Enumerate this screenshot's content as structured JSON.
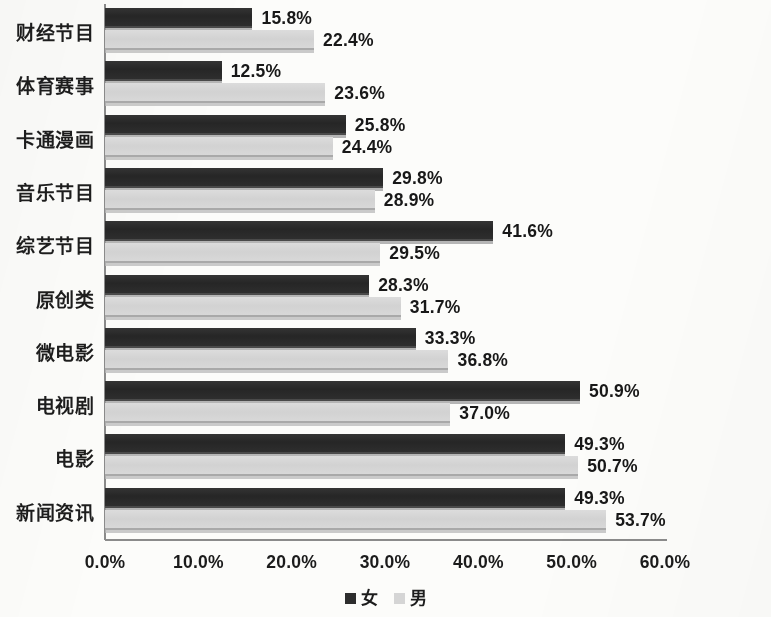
{
  "chart_data": {
    "type": "bar",
    "orientation": "horizontal",
    "title": "",
    "subtitle": "",
    "xlabel": "",
    "ylabel": "",
    "xlim": [
      0,
      60
    ],
    "xtick_labels": [
      "0.0%",
      "10.0%",
      "20.0%",
      "30.0%",
      "40.0%",
      "50.0%",
      "60.0%"
    ],
    "xtick_values": [
      0,
      10,
      20,
      30,
      40,
      50,
      60
    ],
    "grid": false,
    "legend_position": "bottom-center",
    "categories": [
      "财经节目",
      "体育赛事",
      "卡通漫画",
      "音乐节目",
      "综艺节目",
      "原创类",
      "微电影",
      "电视剧",
      "电影",
      "新闻资讯"
    ],
    "series": [
      {
        "name": "女",
        "color": "#2d2d2d",
        "values": [
          15.8,
          12.5,
          25.8,
          29.8,
          41.6,
          28.3,
          33.3,
          50.9,
          49.3,
          49.3
        ],
        "labels": [
          "15.8%",
          "12.5%",
          "25.8%",
          "29.8%",
          "41.6%",
          "28.3%",
          "33.3%",
          "50.9%",
          "49.3%",
          "49.3%"
        ]
      },
      {
        "name": "男",
        "color": "#d5d5d5",
        "values": [
          22.4,
          23.6,
          24.4,
          28.9,
          29.5,
          31.7,
          36.8,
          37.0,
          50.7,
          53.7
        ],
        "labels": [
          "22.4%",
          "23.6%",
          "24.4%",
          "28.9%",
          "29.5%",
          "31.7%",
          "36.8%",
          "37.0%",
          "50.7%",
          "53.7%"
        ]
      }
    ]
  },
  "legend": {
    "items": [
      {
        "label": "女",
        "color": "#2d2d2d"
      },
      {
        "label": "男",
        "color": "#d5d5d5"
      }
    ]
  }
}
